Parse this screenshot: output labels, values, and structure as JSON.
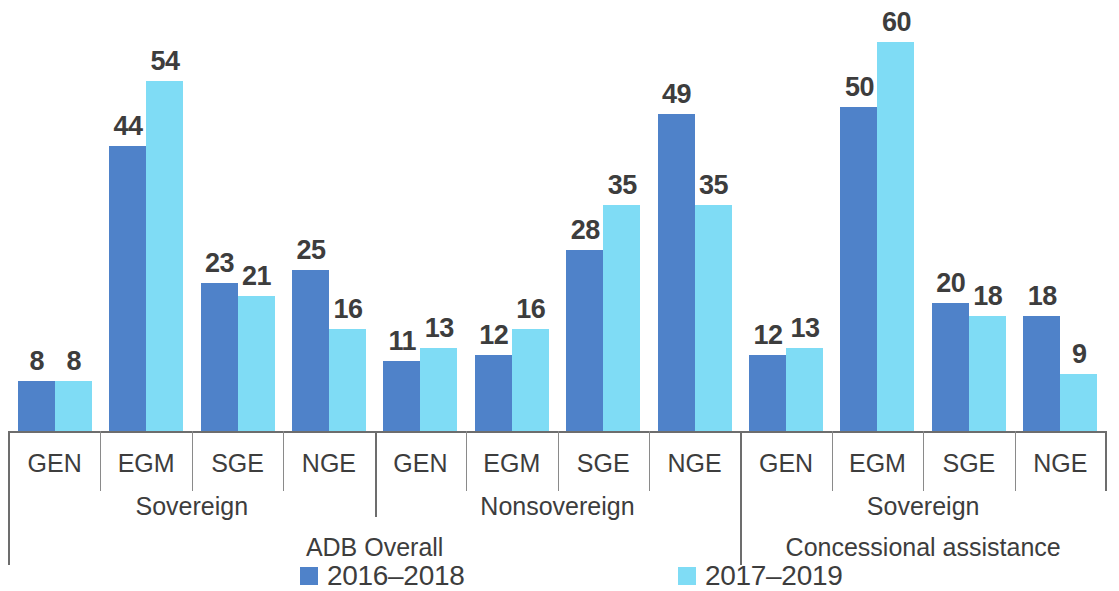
{
  "chart_data": {
    "type": "bar",
    "title": "",
    "xlabel": "",
    "ylabel": "",
    "ylim": [
      0,
      60
    ],
    "grid": false,
    "legend_position": "bottom",
    "categories": [
      "GEN",
      "EGM",
      "SGE",
      "NGE",
      "GEN",
      "EGM",
      "SGE",
      "NGE",
      "GEN",
      "EGM",
      "SGE",
      "NGE"
    ],
    "series": [
      {
        "name": "2016–2018",
        "color": "#4f82c9",
        "values": [
          8,
          44,
          23,
          25,
          11,
          12,
          28,
          49,
          12,
          50,
          20,
          18
        ]
      },
      {
        "name": "2017–2019",
        "color": "#7fdcf5",
        "values": [
          8,
          54,
          21,
          16,
          13,
          16,
          35,
          35,
          13,
          60,
          18,
          9
        ]
      }
    ],
    "groups": [
      {
        "label": "Sovereign",
        "categories": [
          "GEN",
          "EGM",
          "SGE",
          "NGE"
        ]
      },
      {
        "label": "Nonsovereign",
        "categories": [
          "GEN",
          "EGM",
          "SGE",
          "NGE"
        ]
      },
      {
        "label": "Sovereign",
        "categories": [
          "GEN",
          "EGM",
          "SGE",
          "NGE"
        ]
      }
    ],
    "supergroups": [
      {
        "label": "ADB Overall",
        "groups": [
          "Sovereign",
          "Nonsovereign"
        ]
      },
      {
        "label": "Concessional assistance",
        "groups": [
          "Sovereign"
        ]
      }
    ]
  },
  "axis": {
    "cells": [
      {
        "label": "GEN"
      },
      {
        "label": "EGM"
      },
      {
        "label": "SGE"
      },
      {
        "label": "NGE"
      },
      {
        "label": "GEN"
      },
      {
        "label": "EGM"
      },
      {
        "label": "SGE"
      },
      {
        "label": "NGE"
      },
      {
        "label": "GEN"
      },
      {
        "label": "EGM"
      },
      {
        "label": "SGE"
      },
      {
        "label": "NGE"
      }
    ],
    "group_labels": [
      "Sovereign",
      "Nonsovereign",
      "Sovereign"
    ],
    "super_labels": [
      "ADB Overall",
      "Concessional assistance"
    ]
  },
  "legend": {
    "entries": [
      {
        "label": "2016–2018",
        "color": "#4f82c9"
      },
      {
        "label": "2017–2019",
        "color": "#7fdcf5"
      }
    ]
  }
}
